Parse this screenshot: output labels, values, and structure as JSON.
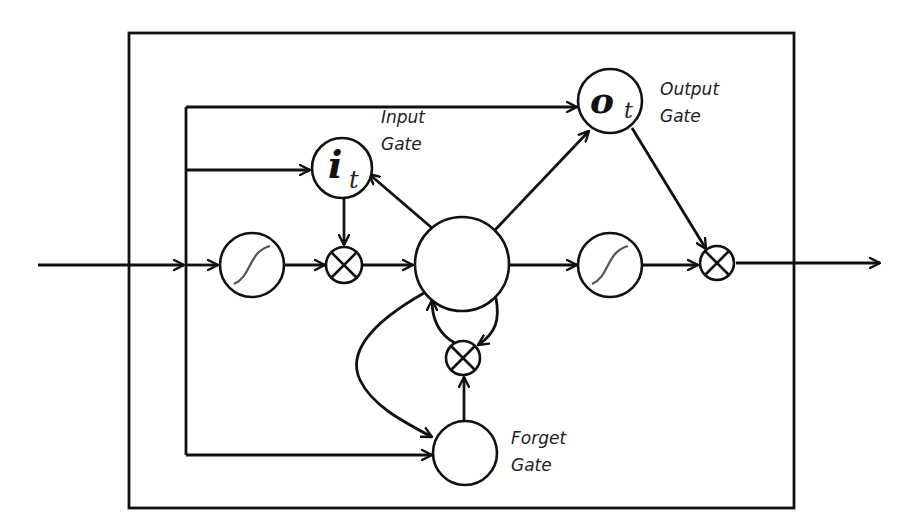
{
  "diagram": {
    "type": "LSTM memory cell",
    "labels": {
      "input_gate": [
        "Input",
        "Gate"
      ],
      "output_gate": [
        "Output",
        "Gate"
      ],
      "forget_gate": [
        "Forget",
        "Gate"
      ]
    },
    "symbols": {
      "input_gate": {
        "main": "i",
        "sub": "t"
      },
      "output_gate": {
        "main": "o",
        "sub": "t"
      }
    },
    "nodes": [
      {
        "id": "input-gate",
        "kind": "gate",
        "symbol": "i_t"
      },
      {
        "id": "output-gate",
        "kind": "gate",
        "symbol": "o_t"
      },
      {
        "id": "forget-gate",
        "kind": "gate"
      },
      {
        "id": "input-squash",
        "kind": "sigmoid"
      },
      {
        "id": "output-squash",
        "kind": "sigmoid"
      },
      {
        "id": "cell",
        "kind": "memory-cell"
      },
      {
        "id": "input-multiplier",
        "kind": "multiply"
      },
      {
        "id": "forget-multiplier",
        "kind": "multiply"
      },
      {
        "id": "output-multiplier",
        "kind": "multiply"
      }
    ],
    "colors": {
      "stroke": "#111111",
      "sigmoid_curve": "#555555",
      "background": "#ffffff"
    }
  }
}
